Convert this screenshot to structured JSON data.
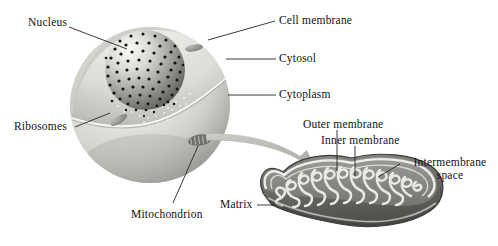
{
  "figure": {
    "background_color": "#ffffff",
    "text_color": "#111111",
    "leader_line_color": "#2a2a2a",
    "cell": {
      "fill_light": "#e8e8e6",
      "fill_mid": "#cfcfcb",
      "fill_shadow": "#a9a9a4"
    },
    "nucleus": {
      "fill_light": "#f2f2f0",
      "fill_dark": "#6f6f6c",
      "dot_color": "#141414",
      "dot_count": 78
    },
    "mitochondrion": {
      "body_dark": "#5e5e5b",
      "body_mid": "#7e7e7a",
      "crista_light": "#e6e6e2",
      "outline": "#3a3a38"
    },
    "arrow": {
      "color": "#b3b3ae"
    }
  },
  "labels": {
    "nucleus": "Nucleus",
    "cell_membrane": "Cell membrane",
    "cytosol": "Cytosol",
    "cytoplasm": "Cytoplasm",
    "ribosomes": "Ribosomes",
    "mitochondrion": "Mitochondrion",
    "outer_membrane": "Outer membrane",
    "inner_membrane": "Inner membrane",
    "intermembrane_space_line1": "Intermembrane",
    "intermembrane_space_line2": "space",
    "matrix": "Matrix"
  }
}
